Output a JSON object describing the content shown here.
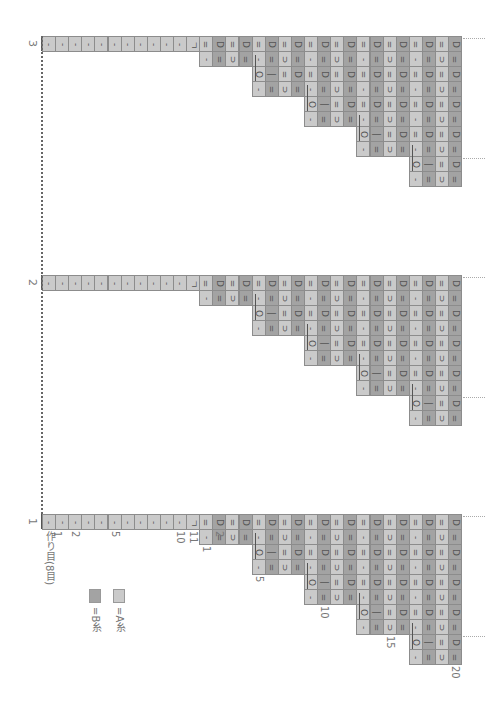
{
  "colors": {
    "A": "#cacaca",
    "B": "#a3a3a3",
    "grid": "#8c8c8c"
  },
  "grid": {
    "origin_x": 42,
    "col_w": 13.1,
    "row_h": 15,
    "cast_on_cells": 12,
    "pattern_cols": 20
  },
  "charts": [
    {
      "label": "3",
      "top": 36
    },
    {
      "label": "2",
      "top": 275
    },
    {
      "label": "1",
      "top": 514
    }
  ],
  "cast_on": {
    "symbols": [
      "-",
      "-",
      "-",
      "-",
      "-",
      "-",
      "-",
      "-",
      "-",
      "-",
      "-",
      "ㄱ"
    ],
    "labels": [
      {
        "text": "1",
        "col": 0.6
      },
      {
        "text": "2",
        "col": 2
      },
      {
        "text": "5",
        "col": 5
      },
      {
        "text": "10",
        "col": 10
      },
      {
        "text": "11",
        "col": 11
      },
      {
        "text": "作り目(8目)",
        "col": 0
      }
    ]
  },
  "rows": [
    {
      "start": 1,
      "first": null,
      "odd": "=",
      "even": "D"
    },
    {
      "start": 1,
      "first": "-",
      "odd": "⊃",
      "even": "=",
      "slopes": [
        5,
        9,
        13,
        17
      ]
    },
    {
      "start": 5,
      "first": "O",
      "second": "|",
      "odd": "=",
      "even": "D"
    },
    {
      "start": 5,
      "first": "-",
      "odd": "⊃",
      "even": "=",
      "slopes": [
        9,
        13,
        17
      ]
    },
    {
      "start": 9,
      "first": "O",
      "second": "|",
      "odd": "=",
      "even": "D"
    },
    {
      "start": 9,
      "first": "-",
      "odd": "⊃",
      "even": "=",
      "slopes": [
        13,
        17
      ]
    },
    {
      "start": 13,
      "first": "O",
      "second": "|",
      "odd": "=",
      "even": "D"
    },
    {
      "start": 13,
      "first": "-",
      "odd": "⊃",
      "even": "=",
      "slopes": [
        17
      ]
    },
    {
      "start": 17,
      "first": "O",
      "second": "|",
      "odd": "=",
      "even": "D"
    },
    {
      "start": 17,
      "first": "-",
      "odd": "⊃",
      "even": "=",
      "slopes": []
    }
  ],
  "row_number_labels": [
    {
      "text": "1",
      "col": 1,
      "row": 2
    },
    {
      "text": "2",
      "col": 2,
      "row": 1
    },
    {
      "text": "5",
      "col": 5,
      "row": 4
    },
    {
      "text": "10",
      "col": 10,
      "row": 6
    },
    {
      "text": "15",
      "col": 15,
      "row": 8
    },
    {
      "text": "20",
      "col": 20,
      "row": 10
    }
  ],
  "legend": [
    {
      "key": "B",
      "text": "=B糸",
      "color": "#a3a3a3",
      "x": 89
    },
    {
      "key": "A",
      "text": "=A糸",
      "color": "#cacaca",
      "x": 113
    }
  ]
}
